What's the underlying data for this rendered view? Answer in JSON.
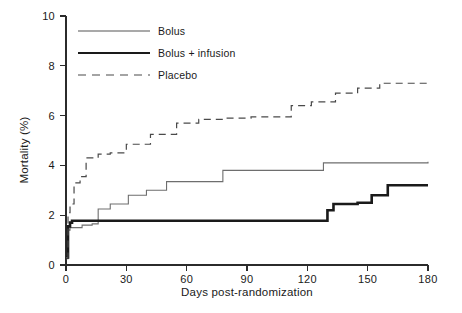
{
  "chart_data": {
    "type": "line",
    "title": "",
    "subtitle": "",
    "xlabel": "Days post-randomization",
    "ylabel": "Mortality (%)",
    "xlim": [
      0,
      180
    ],
    "ylim": [
      0,
      10
    ],
    "xticks": [
      0,
      30,
      60,
      90,
      120,
      150,
      180
    ],
    "yticks": [
      0,
      2,
      4,
      6,
      8,
      10
    ],
    "xtick_labels": [
      "0",
      "30",
      "60",
      "90",
      "120",
      "150",
      "180"
    ],
    "ytick_labels": [
      "0",
      "2",
      "4",
      "6",
      "8",
      "10"
    ],
    "grid": false,
    "legend_position": "top-left",
    "step_type": "post",
    "series": [
      {
        "name": "Bolus",
        "style": "thin-solid",
        "color": "#6e6e6e",
        "x": [
          0,
          1,
          2,
          4,
          8,
          13,
          16,
          22,
          31,
          40,
          50,
          58,
          78,
          128,
          180
        ],
        "y": [
          0.25,
          1.4,
          1.5,
          1.5,
          1.6,
          1.65,
          2.25,
          2.45,
          2.8,
          3.0,
          3.35,
          3.35,
          3.8,
          4.1,
          4.15
        ]
      },
      {
        "name": "Bolus + infusion",
        "style": "thick-solid",
        "color": "#1a1a1a",
        "x": [
          0,
          1,
          2,
          3,
          128,
          130,
          133,
          145,
          152,
          160,
          180
        ],
        "y": [
          0.3,
          1.55,
          1.7,
          1.78,
          1.78,
          2.2,
          2.45,
          2.5,
          2.8,
          3.2,
          3.2
        ]
      },
      {
        "name": "Placebo",
        "style": "dashed",
        "color": "#4a4a4a",
        "x": [
          0,
          1,
          2,
          4,
          7,
          10,
          16,
          22,
          30,
          42,
          55,
          66,
          78,
          92,
          112,
          122,
          134,
          145,
          156,
          180
        ],
        "y": [
          0.3,
          2.1,
          2.45,
          3.3,
          3.55,
          4.3,
          4.45,
          4.5,
          4.85,
          5.25,
          5.7,
          5.85,
          5.9,
          5.95,
          6.4,
          6.55,
          6.9,
          7.1,
          7.3,
          7.3
        ]
      }
    ]
  },
  "legend": {
    "items": [
      {
        "label": "Bolus",
        "style": "thin-solid"
      },
      {
        "label": "Bolus + infusion",
        "style": "thick-solid"
      },
      {
        "label": "Placebo",
        "style": "dashed"
      }
    ]
  },
  "axes": {
    "x_title": "Days post-randomization",
    "y_title": "Mortality (%)"
  }
}
